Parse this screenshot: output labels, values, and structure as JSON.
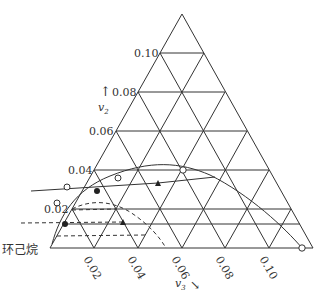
{
  "diagram": {
    "type": "ternary-phase-diagram",
    "corner_label": "环己烷",
    "left_axis": {
      "symbol": "v",
      "subscript": "2",
      "arrow": "↑",
      "ticks": [
        "0.02",
        "0.04",
        "0.06",
        "0.08",
        "0.10"
      ]
    },
    "bottom_axis": {
      "symbol": "v",
      "subscript": "3",
      "arrow": "↘",
      "ticks": [
        "0.02",
        "0.04",
        "0.06",
        "0.08",
        "0.10"
      ]
    },
    "colors": {
      "line": "#333333",
      "background": "#ffffff"
    },
    "markers": {
      "open_circles": [
        [
          57,
          203
        ],
        [
          67,
          187
        ],
        [
          183,
          170
        ],
        [
          302,
          248
        ]
      ],
      "filled_circles": [
        [
          31,
          191
        ],
        [
          21,
          223
        ]
      ],
      "filled_triangles": [
        [
          158,
          183
        ],
        [
          123,
          222
        ]
      ]
    }
  }
}
